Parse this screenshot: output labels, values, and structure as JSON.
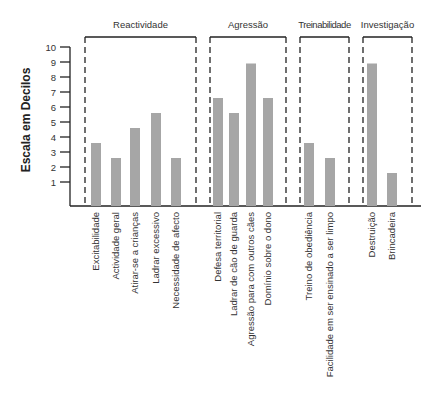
{
  "chart_data": {
    "type": "bar",
    "title": "",
    "xlabel": "",
    "ylabel": "Escala em Decilos",
    "ylim": [
      0,
      10
    ],
    "yticks": [
      1,
      2,
      3,
      4,
      5,
      6,
      7,
      8,
      9,
      10
    ],
    "grid": false,
    "legend": null,
    "bar_color": "#a6a6a6",
    "groups": [
      {
        "name": "Reactividade",
        "categories": [
          "Excitabilidade",
          "Actividade geral",
          "Atirar-se a crianças",
          "Ladrar  excessivo",
          "Necessidade de afecto"
        ],
        "values": [
          3.6,
          2.6,
          4.6,
          5.6,
          2.6
        ]
      },
      {
        "name": "Agressão",
        "categories": [
          "Defesa territorial",
          "Ladrar de cão de guarda",
          "Agressão para com outros cães",
          "Domínio sobre o dono"
        ],
        "values": [
          6.6,
          5.6,
          8.9,
          6.6
        ]
      },
      {
        "name": "Treinabilidade",
        "categories": [
          "Treino de obediência",
          "Facilidade em ser ensinado a ser limpo"
        ],
        "values": [
          3.6,
          2.6
        ]
      },
      {
        "name": "Investigação",
        "categories": [
          "Destruição",
          "Brincadeira"
        ],
        "values": [
          8.9,
          1.6
        ]
      }
    ],
    "categories": [
      "Excitabilidade",
      "Actividade geral",
      "Atirar-se a crianças",
      "Ladrar  excessivo",
      "Necessidade de afecto",
      "Defesa territorial",
      "Ladrar de cão de guarda",
      "Agressão para com outros cães",
      "Domínio sobre o dono",
      "Treino de obediência",
      "Facilidade em ser ensinado a ser limpo",
      "Destruição",
      "Brincadeira"
    ],
    "values": [
      3.6,
      2.6,
      4.6,
      5.6,
      2.6,
      6.6,
      5.6,
      8.9,
      6.6,
      3.6,
      2.6,
      8.9,
      1.6
    ]
  }
}
